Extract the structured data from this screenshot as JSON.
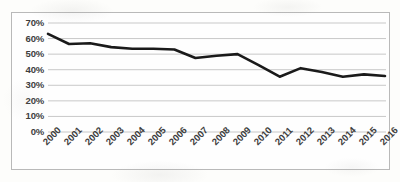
{
  "chart_data": {
    "type": "line",
    "title": "",
    "xlabel": "",
    "ylabel": "",
    "categories": [
      "2000",
      "2001",
      "2002",
      "2003",
      "2004",
      "2005",
      "2006",
      "2007",
      "2008",
      "2009",
      "2010",
      "2011",
      "2012",
      "2013",
      "2014",
      "2015",
      "2016"
    ],
    "values": [
      63,
      56.5,
      57,
      54.5,
      53.5,
      53.5,
      53,
      47.5,
      49,
      50,
      43,
      35.5,
      41,
      38.5,
      35.5,
      37,
      36
    ],
    "series": [
      {
        "name": "series-1",
        "values": [
          63,
          56.5,
          57,
          54.5,
          53.5,
          53.5,
          53,
          47.5,
          49,
          50,
          43,
          35.5,
          41,
          38.5,
          35.5,
          37,
          36
        ]
      }
    ],
    "ylim": [
      0,
      70
    ],
    "ytick_labels": [
      "0%",
      "10%",
      "20%",
      "30%",
      "40%",
      "50%",
      "60%",
      "70%"
    ],
    "ytick_values": [
      0,
      10,
      20,
      30,
      40,
      50,
      60,
      70
    ],
    "grid": true,
    "grid_axis": "y",
    "legend": false,
    "legend_position": "none",
    "line_color": "#1a1a1a",
    "grid_color": "#c8c8c8",
    "border_color": "#b9b9b9",
    "background_color": "#fefefe",
    "markers": false
  }
}
